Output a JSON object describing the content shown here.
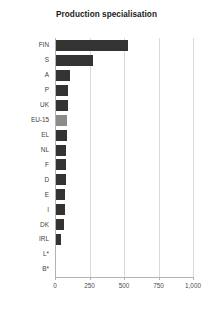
{
  "chart_data": {
    "type": "bar",
    "orientation": "horizontal",
    "title": "Production specialisation",
    "xlabel": "",
    "ylabel": "",
    "categories": [
      "FIN",
      "S",
      "A",
      "P",
      "UK",
      "EU-15",
      "EL",
      "NL",
      "F",
      "D",
      "E",
      "I",
      "DK",
      "IRL",
      "L*",
      "B*"
    ],
    "values": [
      530,
      275,
      110,
      95,
      92,
      88,
      85,
      82,
      80,
      78,
      75,
      72,
      68,
      45,
      0,
      0
    ],
    "series": [
      {
        "name": "Production specialisation",
        "values": [
          530,
          275,
          110,
          95,
          92,
          88,
          85,
          82,
          80,
          78,
          75,
          72,
          68,
          45,
          0,
          0
        ]
      }
    ],
    "highlight_category": "EU-15",
    "xlim": [
      0,
      1000
    ],
    "xticks": [
      0,
      250,
      500,
      750,
      1000
    ],
    "xticklabels": [
      "0",
      "250",
      "500",
      "750",
      "1,000"
    ],
    "grid": true,
    "legend": false,
    "colors": {
      "bar": "#333333",
      "bar_highlight": "#8c8c8c",
      "gridline": "#d9d9d9",
      "axis": "#b3b3b3",
      "text": "#3d3d3d",
      "title": "#1a1a1a",
      "background": "#ffffff"
    }
  }
}
